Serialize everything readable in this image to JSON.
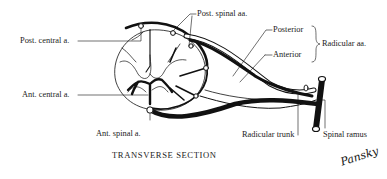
{
  "diagram": {
    "caption": "TRANSVERSE SECTION",
    "signature": "Pansky",
    "labels": {
      "post_central": "Post. central a.",
      "post_spinal": "Post. spinal aa.",
      "posterior": "Posterior",
      "anterior": "Anterior",
      "radicular": "Radicular aa.",
      "ant_central": "Ant. central a.",
      "ant_spinal": "Ant. spinal a.",
      "radicular_trunk": "Radicular trunk",
      "spinal_ramus": "Spinal ramus"
    },
    "colors": {
      "ink": "#111111",
      "background": "#ffffff"
    }
  }
}
